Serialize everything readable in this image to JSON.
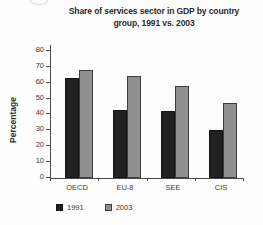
{
  "page": {
    "background": "#fdfdfd"
  },
  "chart_data": {
    "type": "bar",
    "title": "Share of services sector in GDP by country group, 1991 vs. 2003",
    "title_lines": [
      "Share of services sector in GDP by country",
      "group, 1991 vs. 2003"
    ],
    "ylabel": "Percentage",
    "xlabel": "",
    "categories": [
      "OECD",
      "EU-8",
      "SEE",
      "CIS"
    ],
    "series": [
      {
        "name": "1991",
        "color": "#212121",
        "values": [
          63,
          43,
          42,
          30
        ]
      },
      {
        "name": "2003",
        "color": "#8f8f8f",
        "values": [
          68,
          64,
          58,
          47
        ]
      }
    ],
    "ylim": [
      0,
      80
    ],
    "yticks": [
      0,
      10,
      20,
      30,
      40,
      50,
      60,
      70,
      80
    ],
    "grid": false,
    "legend_position": "bottom-left",
    "axis_color": "#4a4a4a",
    "text_color": "#3b3b3b",
    "background_color": "#fdfdfd"
  }
}
